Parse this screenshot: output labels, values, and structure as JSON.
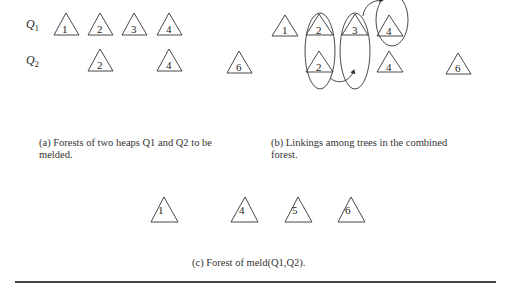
{
  "figure": {
    "panel_a": {
      "row_labels": [
        "Q1",
        "Q2"
      ],
      "row1_trees": [
        "1",
        "2",
        "3",
        "4"
      ],
      "row2_trees": [
        "2",
        "4",
        "6"
      ],
      "caption_line1": "(a) Forests of two heaps Q1 and Q2 to be",
      "caption_line2": "melded."
    },
    "panel_b": {
      "row1_trees": [
        "1",
        "2",
        "3",
        "4"
      ],
      "row2_trees": [
        "2",
        "4",
        "6"
      ],
      "caption_line1": "(b) Linkings among trees in the combined",
      "caption_line2": "forest."
    },
    "panel_c": {
      "trees": [
        "1",
        "4",
        "5",
        "6"
      ],
      "caption": "(c) Forest of meld(Q1,Q2)."
    }
  }
}
